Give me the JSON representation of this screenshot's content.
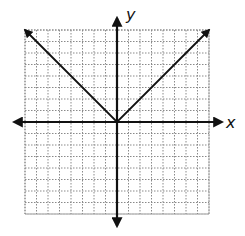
{
  "chart_data": {
    "type": "line",
    "title": "",
    "function": "y = |x|",
    "xlabel": "x",
    "ylabel": "y",
    "xlim": [
      -8,
      8
    ],
    "ylim": [
      -8,
      8
    ],
    "grid": true,
    "grid_style": "dotted",
    "series": [
      {
        "name": "y = |x|",
        "x": [
          -8,
          -4,
          0,
          4,
          8
        ],
        "values": [
          8,
          4,
          0,
          4,
          8
        ],
        "arrows_at_ends": true
      }
    ],
    "axes_arrows": true,
    "tick_labels": false
  },
  "labels": {
    "x_axis": "x",
    "y_axis": "y"
  },
  "colors": {
    "axis": "#111111",
    "grid": "#8a8a8a",
    "line": "#111111",
    "background": "#ffffff"
  }
}
